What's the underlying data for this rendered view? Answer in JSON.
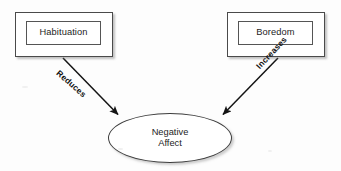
{
  "diagram": {
    "type": "causal-path-diagram",
    "background_color": "#fdfdfd",
    "nodes": [
      {
        "id": "habituation",
        "label": "Habituation",
        "shape": "double-rectangle",
        "x": 15,
        "y": 12,
        "width": 98,
        "height": 45,
        "fill": "#ffffff",
        "stroke": "#4a4a4a"
      },
      {
        "id": "boredom",
        "label": "Boredom",
        "shape": "double-rectangle",
        "x": 227,
        "y": 12,
        "width": 98,
        "height": 45,
        "fill": "#ffffff",
        "stroke": "#4a4a4a"
      },
      {
        "id": "negative-affect",
        "label_line1": "Negative",
        "label_line2": "Affect",
        "shape": "ellipse",
        "x": 108,
        "y": 113,
        "width": 124,
        "height": 50,
        "fill": "#ffffff",
        "stroke": "#3d3d3d"
      }
    ],
    "edges": [
      {
        "id": "habituation-to-negative-affect",
        "from": "habituation",
        "to": "negative-affect",
        "label": "Reduces",
        "arrowhead": "filled-triangle",
        "stroke": "#1a1a1a",
        "x1": 63,
        "y1": 58,
        "x2": 120,
        "y2": 116
      },
      {
        "id": "boredom-to-negative-affect",
        "from": "boredom",
        "to": "negative-affect",
        "label": "Increases",
        "arrowhead": "filled-triangle",
        "stroke": "#1a1a1a",
        "x1": 278,
        "y1": 58,
        "x2": 221,
        "y2": 116
      }
    ]
  }
}
